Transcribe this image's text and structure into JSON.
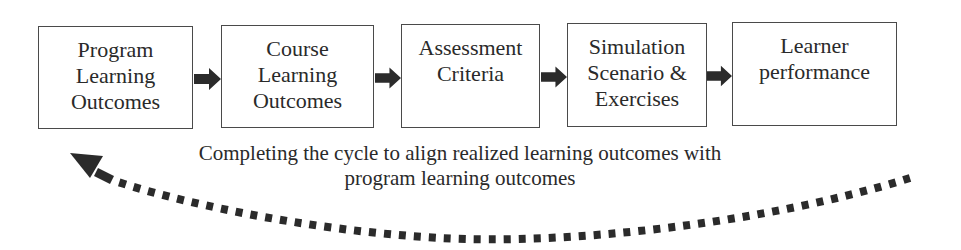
{
  "diagram": {
    "type": "flow-cycle",
    "boxes": [
      {
        "id": "program-learning-outcomes",
        "label": "Program\nLearning\nOutcomes"
      },
      {
        "id": "course-learning-outcomes",
        "label": "Course\nLearning\nOutcomes"
      },
      {
        "id": "assessment-criteria",
        "label": "Assessment\nCriteria"
      },
      {
        "id": "simulation-scenario-exercises",
        "label": "Simulation\nScenario &\nExercises"
      },
      {
        "id": "learner-performance",
        "label": "Learner\nperformance"
      }
    ],
    "arrows": [
      {
        "from": "program-learning-outcomes",
        "to": "course-learning-outcomes",
        "style": "solid-block"
      },
      {
        "from": "course-learning-outcomes",
        "to": "assessment-criteria",
        "style": "solid-block"
      },
      {
        "from": "assessment-criteria",
        "to": "simulation-scenario-exercises",
        "style": "solid-block"
      },
      {
        "from": "simulation-scenario-exercises",
        "to": "learner-performance",
        "style": "solid-block"
      },
      {
        "from": "learner-performance",
        "to": "program-learning-outcomes",
        "style": "dotted-curve"
      }
    ],
    "caption": "Completing the cycle to align realized learning outcomes with\nprogram learning outcomes",
    "colors": {
      "stroke": "#4a4a4a",
      "arrow": "#2b2b2b",
      "text": "#2a2a2a",
      "background": "#ffffff"
    }
  }
}
